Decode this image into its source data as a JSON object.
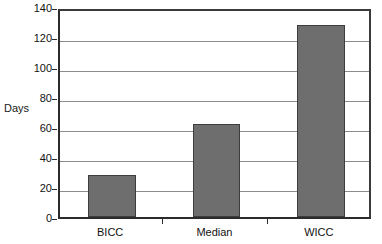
{
  "chart_data": {
    "type": "bar",
    "title": "",
    "subtitle": "",
    "xlabel": "",
    "ylabel": "Days",
    "categories": [
      "BICC",
      "Median",
      "WICC"
    ],
    "values": [
      28,
      62,
      128
    ],
    "series": [
      {
        "name": "Days",
        "values": [
          28,
          62,
          128
        ]
      }
    ],
    "ylim": [
      0,
      140
    ],
    "ytick_step": 20,
    "yticks": [
      0,
      20,
      40,
      60,
      80,
      100,
      120,
      140
    ],
    "ytick_labels": [
      "0",
      "20",
      "40",
      "60",
      "80",
      "100",
      "120",
      "140"
    ],
    "grid": true,
    "grid_axis": "y",
    "legend": false,
    "legend_position": "none",
    "annotations": [],
    "colors": {
      "bar_fill": "#6e6e6e",
      "bar_border": "#3d3d3d",
      "gridline": "#8c8c8c",
      "axis_line": "#2b2b2b",
      "plot_background": "#ffffff",
      "text": "#111111"
    }
  }
}
